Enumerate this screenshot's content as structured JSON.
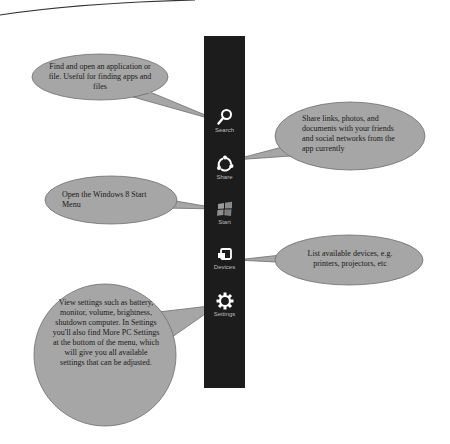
{
  "colors": {
    "charm_bar": "#1c1c1c",
    "bubble_fill": "#a6a6a6",
    "bubble_stroke": "#6e6e6e",
    "icon": "#ffffff",
    "label": "#bcbcbc"
  },
  "charms": [
    {
      "id": "search",
      "label": "Search",
      "icon": "magnifier-icon"
    },
    {
      "id": "share",
      "label": "Share",
      "icon": "share-icon"
    },
    {
      "id": "start",
      "label": "Start",
      "icon": "windows-logo-icon"
    },
    {
      "id": "devices",
      "label": "Devices",
      "icon": "devices-icon"
    },
    {
      "id": "settings",
      "label": "Settings",
      "icon": "gear-icon"
    }
  ],
  "callouts": {
    "search": "Find and open an application or file. Useful for finding apps and files",
    "share": "Share links, photos, and documents with your friends and social networks from the app currently",
    "start": "Open the Windows 8 Start Menu",
    "devices": "List available devices, e.g. printers, projectors, etc",
    "settings": "View settings such as battery, monitor, volume, brightness, shutdown computer. In Settings you'll also find More PC Settings at the bottom of the menu, which will give you all available settings that can be adjusted."
  }
}
